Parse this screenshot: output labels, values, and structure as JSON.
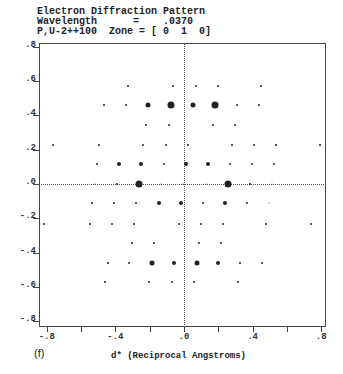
{
  "header": {
    "line1": "Electron Diffraction Pattern",
    "line2": "Wavelength      =    .0370",
    "line3": "P,U-2++100  Zone = [ 0  1  0]"
  },
  "panel_label": "(f)",
  "chart_data": {
    "type": "scatter",
    "title": "Electron Diffraction Pattern",
    "subtitle": "Wavelength = .0370; P,U-2++100 Zone = [ 0 1 0]",
    "xlabel": "d* (Reciprocal Angstroms)",
    "ylabel": "",
    "xlim": [
      -0.84,
      0.83
    ],
    "ylim": [
      -0.83,
      0.83
    ],
    "grid": false,
    "zero_lines": "dotted",
    "x_ticks": [
      ".8",
      ".4",
      ".0",
      "-.4",
      "-.8"
    ],
    "x_tick_labels": [
      "-.8",
      "-.4",
      ".0",
      ".4",
      ".8"
    ],
    "x_tick_values": [
      -0.8,
      -0.4,
      0.0,
      0.4,
      0.8
    ],
    "y_tick_labels": [
      ".8",
      ".6",
      ".4",
      ".2",
      ".0",
      "-.2",
      "-.4",
      "-.6",
      "-.8"
    ],
    "y_tick_values": [
      0.8,
      0.6,
      0.4,
      0.2,
      0.0,
      -0.2,
      -0.4,
      -0.6,
      -0.8
    ],
    "size_legend": {
      "t": "very weak",
      "s": "weak",
      "m": "medium",
      "l": "strong",
      "xl": "very strong"
    },
    "points": [
      {
        "x": -0.326,
        "y": 0.571,
        "size": "s"
      },
      {
        "x": -0.064,
        "y": 0.571,
        "size": "s"
      },
      {
        "x": 0.07,
        "y": 0.571,
        "size": "s"
      },
      {
        "x": 0.198,
        "y": 0.571,
        "size": "s"
      },
      {
        "x": 0.449,
        "y": 0.571,
        "size": "s"
      },
      {
        "x": -0.466,
        "y": 0.461,
        "size": "s"
      },
      {
        "x": -0.338,
        "y": 0.461,
        "size": "s"
      },
      {
        "x": -0.21,
        "y": 0.461,
        "size": "l"
      },
      {
        "x": -0.076,
        "y": 0.461,
        "size": "xl"
      },
      {
        "x": 0.052,
        "y": 0.461,
        "size": "l"
      },
      {
        "x": 0.181,
        "y": 0.461,
        "size": "xl"
      },
      {
        "x": 0.309,
        "y": 0.461,
        "size": "s"
      },
      {
        "x": 0.437,
        "y": 0.461,
        "size": "s"
      },
      {
        "x": -0.222,
        "y": 0.344,
        "size": "s"
      },
      {
        "x": -0.087,
        "y": 0.344,
        "size": "s"
      },
      {
        "x": 0.169,
        "y": 0.344,
        "size": "s"
      },
      {
        "x": 0.297,
        "y": 0.344,
        "size": "s"
      },
      {
        "x": -0.764,
        "y": 0.23,
        "size": "s"
      },
      {
        "x": -0.496,
        "y": 0.23,
        "size": "s"
      },
      {
        "x": -0.239,
        "y": 0.23,
        "size": "s"
      },
      {
        "x": -0.105,
        "y": 0.23,
        "size": "s"
      },
      {
        "x": 0.023,
        "y": 0.23,
        "size": "s"
      },
      {
        "x": 0.28,
        "y": 0.23,
        "size": "s"
      },
      {
        "x": 0.408,
        "y": 0.23,
        "size": "s"
      },
      {
        "x": 0.536,
        "y": 0.23,
        "size": "s"
      },
      {
        "x": 0.793,
        "y": 0.23,
        "size": "s"
      },
      {
        "x": -0.507,
        "y": 0.114,
        "size": "s"
      },
      {
        "x": -0.379,
        "y": 0.114,
        "size": "m"
      },
      {
        "x": -0.251,
        "y": 0.114,
        "size": "m"
      },
      {
        "x": -0.117,
        "y": 0.114,
        "size": "s"
      },
      {
        "x": 0.012,
        "y": 0.114,
        "size": "m"
      },
      {
        "x": 0.14,
        "y": 0.114,
        "size": "m"
      },
      {
        "x": 0.268,
        "y": 0.114,
        "size": "s"
      },
      {
        "x": 0.397,
        "y": 0.114,
        "size": "s"
      },
      {
        "x": 0.525,
        "y": 0.114,
        "size": "s"
      },
      {
        "x": -0.519,
        "y": 0.0,
        "size": "t"
      },
      {
        "x": -0.391,
        "y": 0.0,
        "size": "s"
      },
      {
        "x": -0.262,
        "y": 0.0,
        "size": "xl"
      },
      {
        "x": -0.134,
        "y": 0.0,
        "size": "t"
      },
      {
        "x": -0.006,
        "y": 0.0,
        "size": "t"
      },
      {
        "x": 0.128,
        "y": 0.0,
        "size": "t"
      },
      {
        "x": 0.257,
        "y": 0.0,
        "size": "xl"
      },
      {
        "x": 0.385,
        "y": 0.0,
        "size": "s"
      },
      {
        "x": 0.513,
        "y": 0.0,
        "size": "t"
      },
      {
        "x": -0.536,
        "y": -0.111,
        "size": "s"
      },
      {
        "x": -0.408,
        "y": -0.111,
        "size": "s"
      },
      {
        "x": -0.28,
        "y": -0.111,
        "size": "s"
      },
      {
        "x": -0.146,
        "y": -0.111,
        "size": "m"
      },
      {
        "x": -0.017,
        "y": -0.111,
        "size": "m"
      },
      {
        "x": 0.111,
        "y": -0.111,
        "size": "s"
      },
      {
        "x": 0.239,
        "y": -0.111,
        "size": "m"
      },
      {
        "x": 0.367,
        "y": -0.111,
        "size": "s"
      },
      {
        "x": 0.496,
        "y": -0.111,
        "size": "t"
      },
      {
        "x": -0.816,
        "y": -0.233,
        "size": "s"
      },
      {
        "x": -0.548,
        "y": -0.233,
        "size": "s"
      },
      {
        "x": -0.42,
        "y": -0.233,
        "size": "s"
      },
      {
        "x": -0.292,
        "y": -0.233,
        "size": "s"
      },
      {
        "x": -0.029,
        "y": -0.233,
        "size": "s"
      },
      {
        "x": 0.099,
        "y": -0.233,
        "size": "s"
      },
      {
        "x": 0.227,
        "y": -0.233,
        "size": "s"
      },
      {
        "x": 0.478,
        "y": -0.233,
        "size": "s"
      },
      {
        "x": 0.741,
        "y": -0.233,
        "size": "s"
      },
      {
        "x": -0.303,
        "y": -0.344,
        "size": "s"
      },
      {
        "x": -0.175,
        "y": -0.344,
        "size": "s"
      },
      {
        "x": 0.087,
        "y": -0.344,
        "size": "s"
      },
      {
        "x": 0.216,
        "y": -0.344,
        "size": "s"
      },
      {
        "x": -0.443,
        "y": -0.459,
        "size": "s"
      },
      {
        "x": -0.321,
        "y": -0.459,
        "size": "s"
      },
      {
        "x": -0.187,
        "y": -0.459,
        "size": "l"
      },
      {
        "x": -0.058,
        "y": -0.459,
        "size": "m"
      },
      {
        "x": 0.076,
        "y": -0.459,
        "size": "l"
      },
      {
        "x": 0.198,
        "y": -0.459,
        "size": "m"
      },
      {
        "x": 0.327,
        "y": -0.459,
        "size": "s"
      },
      {
        "x": 0.455,
        "y": -0.459,
        "size": "s"
      },
      {
        "x": -0.461,
        "y": -0.572,
        "size": "s"
      },
      {
        "x": -0.204,
        "y": -0.572,
        "size": "s"
      },
      {
        "x": -0.07,
        "y": -0.572,
        "size": "s"
      },
      {
        "x": 0.058,
        "y": -0.572,
        "size": "s"
      },
      {
        "x": 0.315,
        "y": -0.572,
        "size": "s"
      }
    ]
  }
}
